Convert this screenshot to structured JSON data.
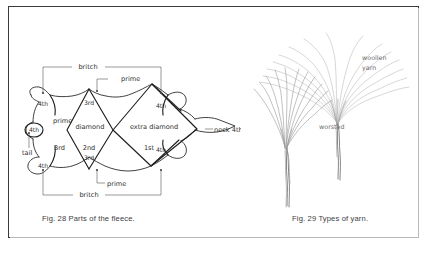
{
  "page": {
    "background": "#ffffff",
    "frame_color": "#3a3a3a"
  },
  "figures": [
    {
      "id": "fig-28",
      "caption": "Fig. 28 Parts of the fleece.",
      "subject": "Parts of the fleece",
      "labels": {
        "britch_top": "britch",
        "britch_bottom": "britch",
        "prime_top": "prime",
        "prime_left": "prime",
        "prime_bottom": "prime",
        "fourth_top_left": "4th",
        "fourth_top_right": "4th",
        "fourth_bottom_left": "4th",
        "fourth_bottom_right": "4th",
        "fourth_tail": "4th",
        "third_top": "3rd",
        "third_bottom": "3rd",
        "third_left": "3rd",
        "second": "2nd",
        "first": "1st",
        "diamond": "diamond",
        "extra_diamond": "extra  diamond",
        "neck": "neck 4th",
        "tail": "tail"
      }
    },
    {
      "id": "fig-29",
      "caption": "Fig. 29 Types of yarn.",
      "subject": "Types of yarn",
      "labels": {
        "woollen_line1": "woollen",
        "woollen_line2": "yarn",
        "worsted": "worsted"
      }
    }
  ]
}
